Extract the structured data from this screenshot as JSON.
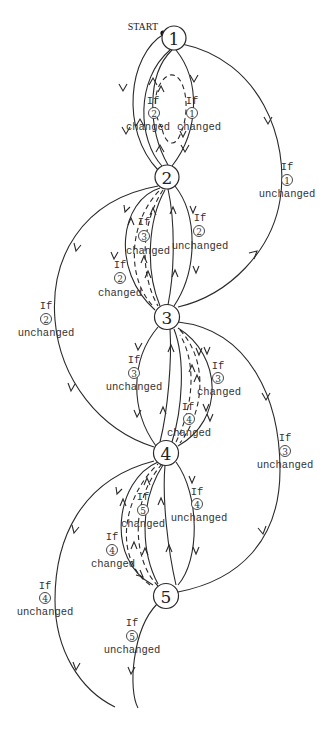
{
  "diagram": {
    "type": "state-transition",
    "start_label": "START",
    "nodes": [
      {
        "id": "1",
        "label": "1",
        "x": 174,
        "y": 38
      },
      {
        "id": "2",
        "label": "2",
        "x": 167,
        "y": 177
      },
      {
        "id": "3",
        "label": "3",
        "x": 167,
        "y": 317
      },
      {
        "id": "4",
        "label": "4",
        "x": 166,
        "y": 453
      },
      {
        "id": "5",
        "label": "5",
        "x": 166,
        "y": 596
      }
    ],
    "edge_labels": [
      {
        "id": "l1",
        "if": "If",
        "num": "2",
        "cond": "changed",
        "x": 150,
        "y": 100
      },
      {
        "id": "l2",
        "if": "If",
        "num": "1",
        "cond": "changed",
        "x": 190,
        "y": 100
      },
      {
        "id": "l3",
        "if": "If",
        "num": "1",
        "cond": "unchanged",
        "x": 287,
        "y": 165
      },
      {
        "id": "l4",
        "if": "If",
        "num": "3",
        "cond": "changed",
        "x": 144,
        "y": 242
      },
      {
        "id": "l5",
        "if": "If",
        "num": "2",
        "cond": "unchanged",
        "x": 198,
        "y": 230
      },
      {
        "id": "l6",
        "if": "If",
        "num": "2",
        "cond": "changed",
        "x": 120,
        "y": 283
      },
      {
        "id": "l7",
        "if": "If",
        "num": "2",
        "cond": "unchanged",
        "x": 46,
        "y": 315
      },
      {
        "id": "l8",
        "if": "If",
        "num": "3",
        "cond": "unchanged",
        "x": 134,
        "y": 362
      },
      {
        "id": "l9",
        "if": "If",
        "num": "3",
        "cond": "changed",
        "x": 218,
        "y": 362
      },
      {
        "id": "l10",
        "if": "If",
        "num": "4",
        "cond": "changed",
        "x": 189,
        "y": 412
      },
      {
        "id": "l11",
        "if": "If",
        "num": "3",
        "cond": "unchanged",
        "x": 285,
        "y": 456
      },
      {
        "id": "l12",
        "if": "If",
        "num": "5",
        "cond": "changed",
        "x": 143,
        "y": 502
      },
      {
        "id": "l13",
        "if": "If",
        "num": "4",
        "cond": "unchanged",
        "x": 198,
        "y": 500
      },
      {
        "id": "l14",
        "if": "If",
        "num": "4",
        "cond": "changed",
        "x": 112,
        "y": 545
      },
      {
        "id": "l15",
        "if": "If",
        "num": "4",
        "cond": "unchanged",
        "x": 45,
        "y": 603
      },
      {
        "id": "l16",
        "if": "If",
        "num": "5",
        "cond": "unchanged",
        "x": 132,
        "y": 640
      }
    ]
  }
}
